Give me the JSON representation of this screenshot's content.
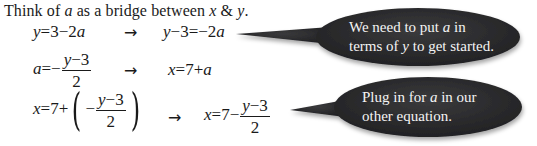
{
  "intro": {
    "prefix": "Think of ",
    "var_a": "a",
    "middle": " as a bridge between ",
    "var_x": "x",
    "amp": " & ",
    "var_y": "y",
    "suffix": "."
  },
  "arrow": "→",
  "rows": [
    {
      "left": {
        "var": "y",
        "rest": "=3−2",
        "var2": "a"
      },
      "right": {
        "var": "y",
        "rest": "−3=−2",
        "var2": "a"
      }
    },
    {
      "left": {
        "var": "a",
        "eq": "=−",
        "num_var": "y",
        "num_rest": "−3",
        "den": "2"
      },
      "right": {
        "var": "x",
        "rest": "=7+",
        "var2": "a"
      }
    },
    {
      "left": {
        "var": "x",
        "eq": "=7+",
        "inner_sign": "−",
        "num_var": "y",
        "num_rest": "−3",
        "den": "2",
        "open_paren": "(",
        "close_paren": ")"
      },
      "right": {
        "var": "x",
        "eq": "=7−",
        "num_var": "y",
        "num_rest": "−3",
        "den": "2"
      }
    }
  ],
  "bubbles": [
    {
      "line1_pre": "We need to put ",
      "line1_var": "a",
      "line1_post": " in",
      "line2_pre": "terms of ",
      "line2_var": "y",
      "line2_post": " to get started."
    },
    {
      "line1_pre": "Plug in for ",
      "line1_var": "a",
      "line1_post": " in our",
      "line2_pre": "other equation.",
      "line2_var": "",
      "line2_post": ""
    }
  ],
  "colors": {
    "bubble_fill": "#2b2b2d",
    "bubble_text": "#f4f4f4",
    "text": "#1a1a1a"
  }
}
